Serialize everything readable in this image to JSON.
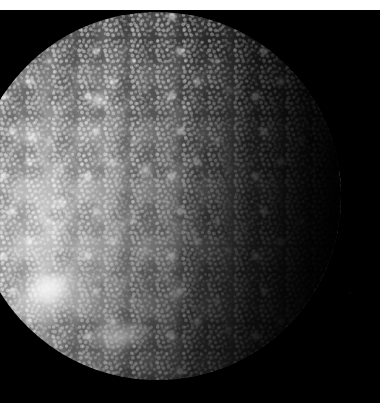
{
  "image": {
    "subject": "Callisto",
    "subject_type": "planetary-moon",
    "capture": "spacecraft-grayscale-photograph",
    "color_mode": "grayscale",
    "width_px": 391,
    "height_px": 411,
    "background_color": "#000000",
    "plate_margin_color": "#ffffff",
    "surface_color_bright": "#c8c8c8",
    "surface_color_mid": "#7a7a7a",
    "surface_color_dark": "#2a2a2a",
    "illumination_direction": "lower-left",
    "terminator_side": "right"
  },
  "scene": {
    "space_background_label": "black space background",
    "disk_label": "Callisto disk",
    "disk_center_x_px": 157,
    "disk_center_y_px": 196,
    "disk_radius_px": 184,
    "disk_cropped_edge": "left",
    "features": {
      "bright_basin": "bright ray basin (lower left)",
      "bright_basin_core": "basin bright core",
      "bottom_rays": "bright ray patch (bottom center)",
      "limb_bulge": "bright limb bulge (left edge)",
      "crater_field": "dense bright crater field",
      "dark_mottling": "dark intercrater plains",
      "limb_arc": "sunlit limb arc"
    }
  },
  "plate": {
    "top_margin_label": "top white margin",
    "right_margin_label": "right white margin",
    "bottom_margin_label": "bottom white margin"
  }
}
